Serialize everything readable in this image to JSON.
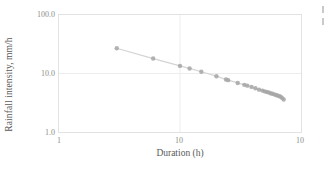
{
  "chart_data": {
    "type": "line",
    "title": "",
    "subtitle": "",
    "xlabel": "Duration (h)",
    "ylabel": "Rainfall intensity, mm/h",
    "xscale": "log",
    "yscale": "log",
    "xlim": [
      1,
      100
    ],
    "ylim": [
      1,
      100
    ],
    "grid": true,
    "legend": null,
    "legend_position": "none",
    "xticks": [
      1,
      10,
      100
    ],
    "xtick_labels": [
      "1",
      "10",
      "10"
    ],
    "yticks": [
      1,
      10,
      100
    ],
    "ytick_labels": [
      "1.0",
      "10.0",
      "100.0"
    ],
    "series": [
      {
        "name": "Rainfall intensity",
        "marker": "circle",
        "marker_color": "#a6a6a6",
        "line_color": "#d4d4d4",
        "x": [
          3.0,
          6.0,
          10.0,
          12.0,
          15.0,
          20.0,
          24.0,
          25.0,
          30.0,
          34.0,
          36.0,
          39.0,
          42.0,
          45.0,
          48.0,
          50.0,
          52.0,
          54.0,
          56.0,
          58.0,
          60.0,
          62.0,
          64.0,
          66.0,
          68.0,
          70.0,
          72.0
        ],
        "y": [
          27.0,
          18.0,
          13.5,
          12.2,
          10.7,
          9.0,
          7.9,
          7.7,
          6.9,
          6.4,
          6.2,
          5.9,
          5.6,
          5.3,
          5.1,
          4.95,
          4.85,
          4.75,
          4.6,
          4.5,
          4.4,
          4.3,
          4.2,
          4.1,
          4.0,
          3.8,
          3.6
        ]
      }
    ]
  },
  "colors": {
    "marker": "#a6a6a6",
    "line": "#d4d4d4",
    "gridline": "#ededed",
    "frame": "#e2e2e2",
    "tick_text": "#8c8c8c",
    "axis_title_text": "#595959",
    "background": "#ffffff"
  },
  "artifact": {
    "name": "cropped-edge-marks"
  }
}
